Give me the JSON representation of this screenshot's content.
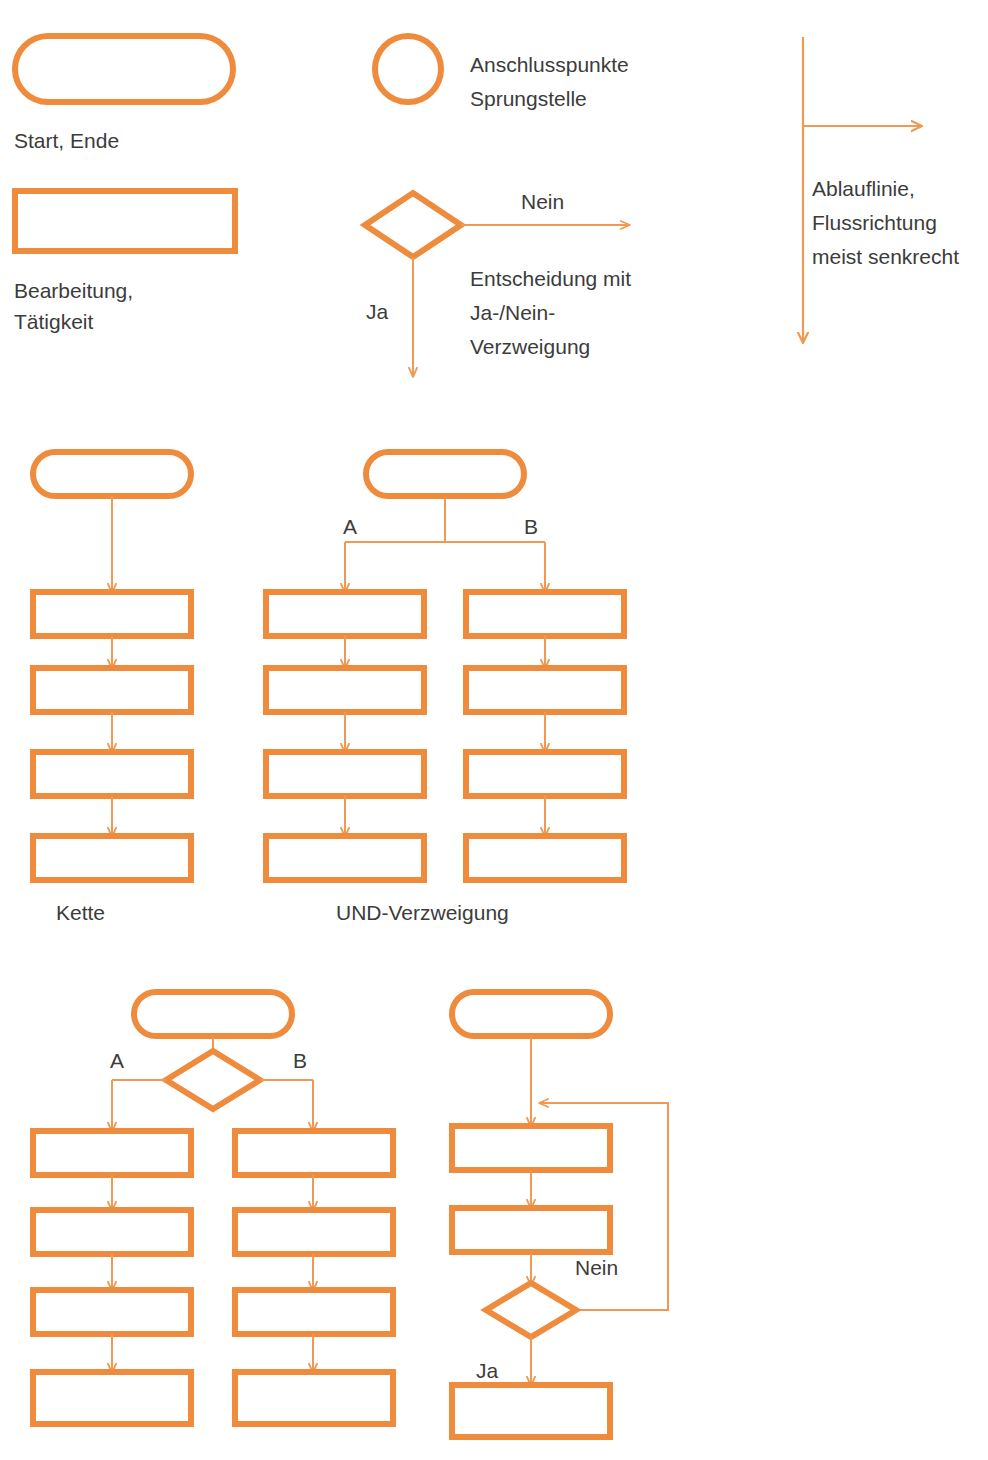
{
  "page": {
    "background_color": "#ffffff",
    "accent_color": "#ee8b3c",
    "accent_color_thin": "#ef9a54",
    "text_color": "#3c3c3c",
    "width": 988,
    "height": 1460,
    "top_clipped_text": ""
  },
  "legend": {
    "start_end": {
      "symbol": "rounded-rectangle",
      "label": "Start, Ende"
    },
    "process": {
      "symbol": "rectangle",
      "label_line1": "Bearbeitung,",
      "label_line2": "Tätigkeit"
    },
    "connector": {
      "symbol": "circle",
      "label_line1": "Anschlusspunkte",
      "label_line2": "Sprungstelle"
    },
    "decision": {
      "symbol": "diamond",
      "yes_label": "Ja",
      "no_label": "Nein",
      "label_line1": "Entscheidung mit",
      "label_line2": "Ja-/Nein-",
      "label_line3": "Verzweigung"
    },
    "flowline": {
      "symbol": "arrow",
      "label_line1": "Ablauflinie,",
      "label_line2": "Flussrichtung",
      "label_line3": "meist senkrecht"
    }
  },
  "structures": {
    "chain": {
      "caption": "Kette",
      "start_symbol": "rounded-rectangle",
      "process_count": 4
    },
    "and_branch": {
      "caption": "UND-Verzweigung",
      "start_symbol": "rounded-rectangle",
      "branch_a_label": "A",
      "branch_b_label": "B",
      "process_count_per_branch": 4
    },
    "or_branch": {
      "caption": "",
      "start_symbol": "rounded-rectangle",
      "decision_symbol": "diamond",
      "branch_a_label": "A",
      "branch_b_label": "B",
      "process_count_per_branch": 4
    },
    "loop": {
      "caption": "",
      "start_symbol": "rounded-rectangle",
      "process_count": 2,
      "decision_symbol": "diamond",
      "no_label": "Nein",
      "yes_label": "Ja",
      "final_process": true
    }
  }
}
